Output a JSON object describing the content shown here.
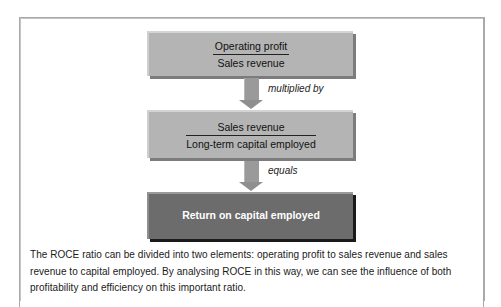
{
  "diagram": {
    "boxes": [
      {
        "numerator": "Operating profit",
        "denominator": "Sales revenue"
      },
      {
        "numerator": "Sales revenue",
        "denominator": "Long-term capital employed"
      },
      {
        "label": "Return on capital employed"
      }
    ],
    "connectors": [
      "multiplied by",
      "equals"
    ],
    "colors": {
      "light_box": "#b4b4b4",
      "dark_box": "#6c6c6c",
      "arrow": "#9a9a9a",
      "frame": "#a9a9a9"
    }
  },
  "caption": "The ROCE ratio can be divided into two elements: operating profit to sales revenue and sales revenue to capital employed. By analysing ROCE in this way, we can see the influence of both profitability and efficiency on this important ratio."
}
